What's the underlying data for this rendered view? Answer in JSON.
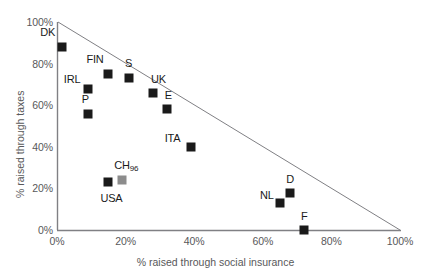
{
  "chart_data": {
    "type": "scatter",
    "title": "",
    "xlabel": "% raised through social insurance",
    "ylabel": "% raised through taxes",
    "xlim": [
      0,
      100
    ],
    "ylim": [
      0,
      100
    ],
    "grid": false,
    "legend": "none",
    "xticks": [
      "0%",
      "20%",
      "40%",
      "60%",
      "80%",
      "100%"
    ],
    "xtick_values": [
      0,
      20,
      40,
      60,
      80,
      100
    ],
    "yticks": [
      "0%",
      "20%",
      "40%",
      "60%",
      "80%",
      "100%"
    ],
    "ytick_values": [
      0,
      20,
      40,
      60,
      80,
      100
    ],
    "annotations": [
      {
        "name": "constraint-line",
        "description": "diagonal line from (0,100) to (100,0)",
        "from": [
          0,
          100
        ],
        "to": [
          100,
          0
        ]
      }
    ],
    "points": [
      {
        "label": "DK",
        "x": 1.5,
        "y": 88,
        "color": "#1a1a1a",
        "label_dx": -22,
        "label_dy": -15
      },
      {
        "label": "FIN",
        "x": 15,
        "y": 75,
        "color": "#1a1a1a",
        "label_dx": -22,
        "label_dy": -15
      },
      {
        "label": "IRL",
        "x": 9,
        "y": 68,
        "color": "#1a1a1a",
        "label_dx": -24,
        "label_dy": -10
      },
      {
        "label": "S",
        "x": 21,
        "y": 73,
        "color": "#1a1a1a",
        "label_dx": -4,
        "label_dy": -15
      },
      {
        "label": "UK",
        "x": 28,
        "y": 66,
        "color": "#1a1a1a",
        "label_dx": -2,
        "label_dy": -14
      },
      {
        "label": "P",
        "x": 9,
        "y": 56,
        "color": "#1a1a1a",
        "label_dx": -6,
        "label_dy": -15
      },
      {
        "label": "E",
        "x": 32,
        "y": 58,
        "color": "#1a1a1a",
        "label_dx": -2,
        "label_dy": -14
      },
      {
        "label": "ITA",
        "x": 39,
        "y": 40,
        "color": "#1a1a1a",
        "label_dx": -26,
        "label_dy": -9
      },
      {
        "label": "USA",
        "x": 15,
        "y": 23,
        "color": "#1a1a1a",
        "label_dx": -8,
        "label_dy": 16
      },
      {
        "label": "CH96",
        "x": 19,
        "y": 24,
        "color": "#8c8c8c",
        "label_dx": -8,
        "label_dy": -15
      },
      {
        "label": "D",
        "x": 68,
        "y": 18,
        "color": "#1a1a1a",
        "label_dx": -4,
        "label_dy": -14
      },
      {
        "label": "NL",
        "x": 65,
        "y": 13,
        "color": "#1a1a1a",
        "label_dx": -20,
        "label_dy": -8
      },
      {
        "label": "F",
        "x": 72,
        "y": 0,
        "color": "#1a1a1a",
        "label_dx": -3,
        "label_dy": -14
      }
    ]
  },
  "colors": {
    "axis": "#808084",
    "marker_black": "#1a1a1a",
    "marker_gray": "#8c8c8c",
    "text": "#58585a",
    "label_text": "#1a1a1a",
    "background": "#ffffff"
  }
}
